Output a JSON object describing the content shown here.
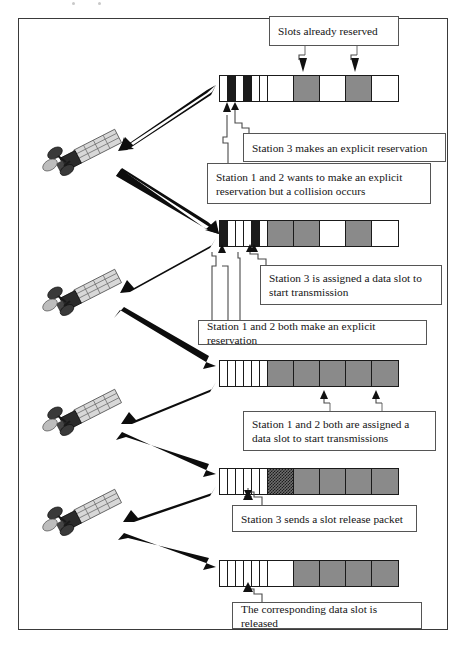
{
  "figure": {
    "frame_border_color": "#3a3a3a"
  },
  "legend_colors": {
    "reserved_data_slot": "#8a8a8a",
    "free_slot": "#ffffff",
    "reservation_minislot_used": "#1b1b1b",
    "release_packet_slot": "#6e6e6e"
  },
  "callouts": [
    {
      "id": "slots-already-reserved",
      "text": "Slots already reserved"
    },
    {
      "id": "station3-explicit-reservation",
      "text": "Station 3 makes an explicit reservation"
    },
    {
      "id": "station12-collision",
      "text": "Station 1 and 2 wants to make an explicit reservation but a collision occurs"
    },
    {
      "id": "station3-assigned-slot",
      "text": "Station 3 is assigned a data slot to start transmission"
    },
    {
      "id": "station12-both-reserve",
      "text": "Station 1 and 2 both make an explicit reservation"
    },
    {
      "id": "station12-both-assigned",
      "text": "Station 1 and 2 both are assigned a data slot to start transmissions"
    },
    {
      "id": "station3-release-packet",
      "text": "Station 3 sends a slot release packet"
    },
    {
      "id": "slot-released",
      "text": "The corresponding data slot is released"
    }
  ],
  "frames": [
    {
      "id": "frame-1",
      "minislots": [
        "white",
        "black",
        "white",
        "black",
        "white",
        "white"
      ],
      "data_slots": [
        "white",
        "gray",
        "white",
        "gray",
        "white"
      ]
    },
    {
      "id": "frame-2",
      "minislots": [
        "black",
        "white",
        "white",
        "white",
        "black",
        "white"
      ],
      "data_slots": [
        "gray",
        "gray",
        "white",
        "gray",
        "white"
      ]
    },
    {
      "id": "frame-3",
      "minislots": [
        "white",
        "white",
        "white",
        "white",
        "white",
        "white"
      ],
      "data_slots": [
        "gray",
        "gray",
        "gray",
        "gray",
        "gray"
      ]
    },
    {
      "id": "frame-4",
      "minislots": [
        "white",
        "white",
        "white",
        "white",
        "white",
        "white"
      ],
      "data_slots": [
        "check",
        "gray",
        "gray",
        "gray",
        "gray"
      ]
    },
    {
      "id": "frame-5",
      "minislots": [
        "white",
        "white",
        "white",
        "white",
        "white",
        "white"
      ],
      "data_slots": [
        "white",
        "gray",
        "gray",
        "gray",
        "gray"
      ]
    }
  ],
  "satellites": [
    {
      "id": "satellite-1",
      "label": "satellite"
    },
    {
      "id": "satellite-2",
      "label": "satellite"
    },
    {
      "id": "satellite-3",
      "label": "satellite"
    },
    {
      "id": "satellite-4",
      "label": "satellite"
    }
  ]
}
